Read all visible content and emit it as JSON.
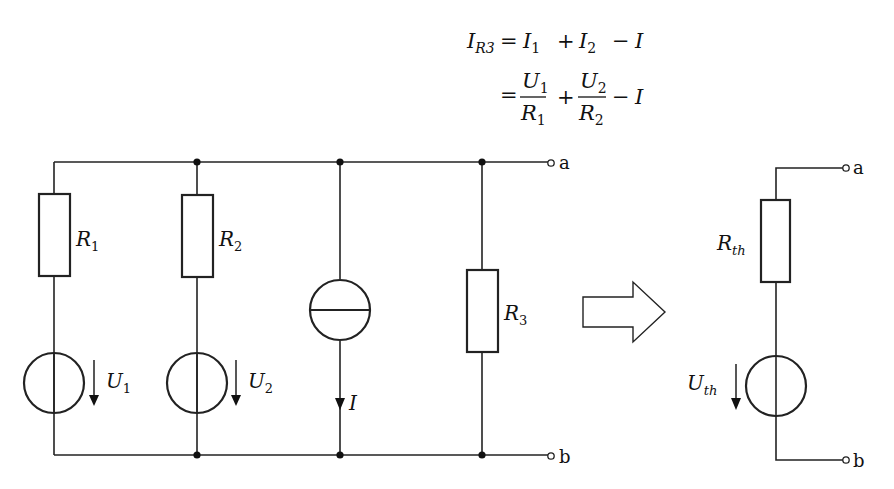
{
  "equation": {
    "line1": {
      "lhs": "I",
      "lhs_sub": "R3",
      "eq": "=",
      "t1": "I",
      "t1_sub": "1",
      "plus": "+",
      "t2": "I",
      "t2_sub": "2",
      "minus": "−",
      "t3": "I"
    },
    "line2": {
      "eq": "=",
      "f1": {
        "num": "U",
        "num_sub": "1",
        "den": "R",
        "den_sub": "1"
      },
      "plus": "+",
      "f2": {
        "num": "U",
        "num_sub": "2",
        "den": "R",
        "den_sub": "2"
      },
      "minus": "−",
      "t3": "I"
    }
  },
  "circuit": {
    "components": [
      {
        "id": "R1",
        "type": "resistor",
        "label": "R",
        "sub": "1"
      },
      {
        "id": "R2",
        "type": "resistor",
        "label": "R",
        "sub": "2"
      },
      {
        "id": "R3",
        "type": "resistor",
        "label": "R",
        "sub": "3"
      },
      {
        "id": "U1",
        "type": "voltage-source",
        "label": "U",
        "sub": "1"
      },
      {
        "id": "U2",
        "type": "voltage-source",
        "label": "U",
        "sub": "2"
      },
      {
        "id": "I",
        "type": "current-source",
        "label": "I"
      }
    ],
    "terminals": {
      "a": "a",
      "b": "b"
    }
  },
  "equivalent": {
    "components": [
      {
        "id": "Rth",
        "type": "resistor",
        "label": "R",
        "sub": "th"
      },
      {
        "id": "Uth",
        "type": "voltage-source",
        "label": "U",
        "sub": "th"
      }
    ],
    "terminals": {
      "a": "a",
      "b": "b"
    }
  },
  "transform_arrow": "right-arrow"
}
